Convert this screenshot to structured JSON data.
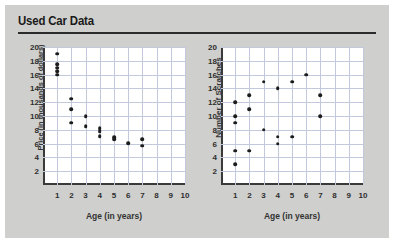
{
  "header": {
    "title": "Used Car Data"
  },
  "chart_data": [
    {
      "type": "scatter",
      "title": "Used Car Data",
      "xlabel": "Age (in years)",
      "ylabel": "Price (in thousands of dollars)",
      "xlim": [
        0,
        10
      ],
      "ylim": [
        0,
        20
      ],
      "xticks": [
        1,
        2,
        3,
        4,
        5,
        6,
        7,
        8,
        9,
        10
      ],
      "yticks": [
        2,
        4,
        6,
        8,
        10,
        12,
        14,
        16,
        18,
        20
      ],
      "grid": true,
      "legend": "none",
      "points": [
        {
          "x": 1,
          "y": 19
        },
        {
          "x": 1,
          "y": 17.5
        },
        {
          "x": 1,
          "y": 17
        },
        {
          "x": 1,
          "y": 16.5
        },
        {
          "x": 1,
          "y": 16
        },
        {
          "x": 2,
          "y": 12.5
        },
        {
          "x": 2,
          "y": 11
        },
        {
          "x": 2,
          "y": 9
        },
        {
          "x": 3,
          "y": 10
        },
        {
          "x": 3,
          "y": 8.5
        },
        {
          "x": 4,
          "y": 8.2
        },
        {
          "x": 4,
          "y": 7.8
        },
        {
          "x": 4,
          "y": 7.1
        },
        {
          "x": 5,
          "y": 6.9
        },
        {
          "x": 5,
          "y": 6.6
        },
        {
          "x": 6,
          "y": 6.1
        },
        {
          "x": 7,
          "y": 6.6
        },
        {
          "x": 7,
          "y": 5.7
        }
      ]
    },
    {
      "type": "scatter",
      "title": "Used Car Data",
      "xlabel": "Age (in years)",
      "ylabel": "Number of Scratches",
      "xlim": [
        0,
        10
      ],
      "ylim": [
        0,
        20
      ],
      "xticks": [
        1,
        2,
        3,
        4,
        5,
        6,
        7,
        8,
        9,
        10
      ],
      "yticks": [
        2,
        4,
        6,
        8,
        10,
        12,
        14,
        16,
        18,
        20
      ],
      "grid": true,
      "legend": "none",
      "points": [
        {
          "x": 1,
          "y": 12
        },
        {
          "x": 1,
          "y": 10
        },
        {
          "x": 1,
          "y": 9
        },
        {
          "x": 1,
          "y": 5
        },
        {
          "x": 1,
          "y": 3
        },
        {
          "x": 2,
          "y": 13
        },
        {
          "x": 2,
          "y": 11
        },
        {
          "x": 2,
          "y": 5
        },
        {
          "x": 3,
          "y": 15
        },
        {
          "x": 3,
          "y": 8
        },
        {
          "x": 4,
          "y": 14
        },
        {
          "x": 4,
          "y": 7
        },
        {
          "x": 4,
          "y": 6
        },
        {
          "x": 5,
          "y": 15
        },
        {
          "x": 5,
          "y": 7
        },
        {
          "x": 6,
          "y": 16
        },
        {
          "x": 7,
          "y": 13
        },
        {
          "x": 7,
          "y": 10
        }
      ]
    }
  ],
  "colors": {
    "background": "#cfcfcd",
    "plot_background": "#ffffff",
    "grid": "#c3c9dd",
    "axis": "#3a3a3a",
    "point": "#1c1c1c",
    "text": "#2e2e2e"
  }
}
